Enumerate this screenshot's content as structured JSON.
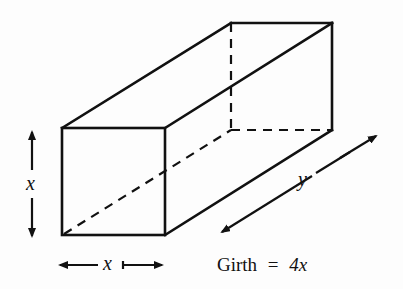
{
  "diagram": {
    "type": "rectangular box (square cross-section)",
    "labels": {
      "height": "x",
      "width": "x",
      "length": "y",
      "girth_text": "Girth",
      "equals": "=",
      "girth_value": "4x"
    },
    "colors": {
      "stroke": "#111111",
      "background": "#fdfdfd"
    }
  }
}
